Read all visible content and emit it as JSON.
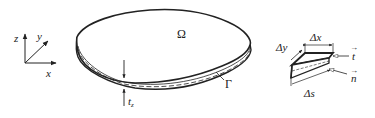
{
  "diagram": {
    "type": "thin plate domain with boundary element",
    "colors": {
      "stroke": "#222222",
      "background": "#ffffff"
    },
    "axes": {
      "x_label": "x",
      "y_label": "y",
      "z_label": "z"
    },
    "plate": {
      "domain_label": "Ω",
      "boundary_label": "Γ",
      "thickness_label": "t",
      "thickness_subscript": "z"
    },
    "element": {
      "dx_label": "Δx",
      "dy_label": "Δy",
      "ds_label": "Δs",
      "tangent_label": "t",
      "normal_label": "n",
      "vector_arrow": "→"
    }
  }
}
